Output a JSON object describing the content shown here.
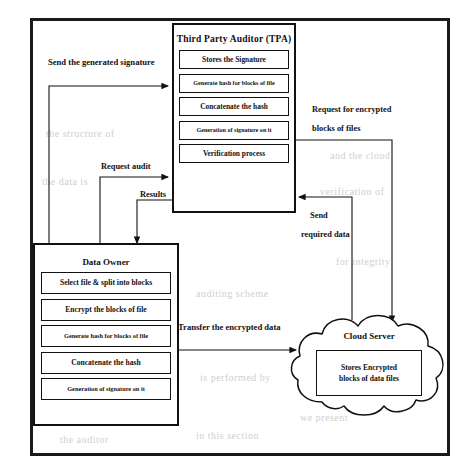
{
  "diagram": {
    "frame": {
      "name": "outer-frame"
    },
    "tpa": {
      "title": "Third Party Auditor (TPA)",
      "steps": [
        "Stores the Signature",
        "Generate hash for blocks of file",
        "Concatenate the hash",
        "Generation of signature on it",
        "Verification process"
      ]
    },
    "owner": {
      "title": "Data Owner",
      "steps": [
        "Select file & split into blocks",
        "Encrypt the blocks of file",
        "Generate hash for blocks of file",
        "Concatenate the hash",
        "Generation of signature on it"
      ]
    },
    "cloud": {
      "title": "Cloud Server",
      "box_line1": "Stores Encrypted",
      "box_line2": "blocks of data files"
    },
    "edges": [
      {
        "id": "send-signature",
        "label": "Send the generated signature",
        "from": "data-owner",
        "to": "tpa"
      },
      {
        "id": "request-audit",
        "label": "Request audit",
        "from": "data-owner",
        "to": "tpa"
      },
      {
        "id": "results",
        "label": "Results",
        "from": "tpa",
        "to": "data-owner"
      },
      {
        "id": "request-encrypted",
        "label_line1": "Request for encrypted",
        "label_line2": "blocks of files",
        "from": "tpa",
        "to": "cloud-server"
      },
      {
        "id": "send-required",
        "label_line1": "Send",
        "label_line2": "required data",
        "from": "cloud-server",
        "to": "tpa"
      },
      {
        "id": "transfer-data",
        "label": "Transfer the encrypted data",
        "from": "data-owner",
        "to": "cloud-server"
      }
    ],
    "colors": {
      "stroke": "#111111",
      "background": "#ffffff",
      "bleed_text": "#cfcfcf"
    }
  },
  "bleed": {
    "lines": [
      "the structure of",
      "sequential order",
      "and the cloud",
      "the data is",
      "verification of",
      "for integrity",
      "auditing scheme",
      "is performed by",
      "the auditor",
      "in this section",
      "we present",
      "the proposed"
    ]
  }
}
